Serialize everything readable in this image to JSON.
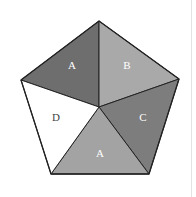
{
  "figure": {
    "shape": "regular pentagon divided into 5 triangular regions from the center",
    "regions": [
      {
        "id": "top-left",
        "label": "A",
        "color": "#6e6e6e"
      },
      {
        "id": "top-right",
        "label": "B",
        "color": "#a9a9a9"
      },
      {
        "id": "right",
        "label": "C",
        "color": "#7d7d7d"
      },
      {
        "id": "bottom",
        "label": "A",
        "color": "#a3a3a3"
      },
      {
        "id": "left",
        "label": "D",
        "color": "#ffffff"
      }
    ],
    "outline_color": "#222222"
  }
}
